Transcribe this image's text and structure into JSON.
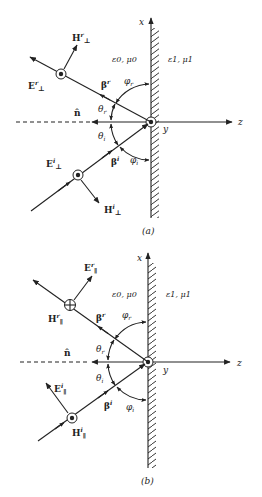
{
  "figure": {
    "colors": {
      "ink": "#222222",
      "background": "#ffffff"
    }
  },
  "panels": [
    {
      "id": "a",
      "caption": "(a)",
      "axes": {
        "x": "x",
        "y": "y",
        "z": "z"
      },
      "normal_label": "n̂",
      "medium_left": "ε0, μ0",
      "medium_right": "ε1, μ1",
      "reflected": {
        "wave_vector": "β",
        "wave_vector_sup": "r",
        "E_label": "E",
        "E_sup": "r",
        "E_sub": "⊥",
        "E_symbol": "out-of-page dot",
        "H_label": "H",
        "H_sup": "r",
        "H_sub": "⊥"
      },
      "incident": {
        "wave_vector": "β",
        "wave_vector_sup": "i",
        "E_label": "E",
        "E_sup": "i",
        "E_sub": "⊥",
        "E_symbol": "out-of-page dot",
        "H_label": "H",
        "H_sup": "i",
        "H_sub": "⊥"
      },
      "angles": {
        "theta_r": "θ",
        "theta_r_sub": "r",
        "theta_i": "θ",
        "theta_i_sub": "i",
        "phi_r": "φ",
        "phi_r_sub": "r",
        "phi_i": "φ",
        "phi_i_sub": "i"
      }
    },
    {
      "id": "b",
      "caption": "(b)",
      "axes": {
        "x": "x",
        "y": "y",
        "z": "z"
      },
      "normal_label": "n̂",
      "medium_left": "ε0, μ0",
      "medium_right": "ε1, μ1",
      "reflected": {
        "wave_vector": "β",
        "wave_vector_sup": "r",
        "E_label": "E",
        "E_sup": "r",
        "E_sub": "∥",
        "H_label": "H",
        "H_sup": "r",
        "H_sub": "∥",
        "H_symbol": "into-page cross"
      },
      "incident": {
        "wave_vector": "β",
        "wave_vector_sup": "i",
        "E_label": "E",
        "E_sup": "i",
        "E_sub": "∥",
        "H_label": "H",
        "H_sup": "i",
        "H_sub": "∥",
        "H_symbol": "out-of-page dot"
      },
      "angles": {
        "theta_r": "θ",
        "theta_r_sub": "r",
        "theta_i": "θ",
        "theta_i_sub": "i",
        "phi_r": "φ",
        "phi_r_sub": "r",
        "phi_i": "φ",
        "phi_i_sub": "i"
      }
    }
  ]
}
